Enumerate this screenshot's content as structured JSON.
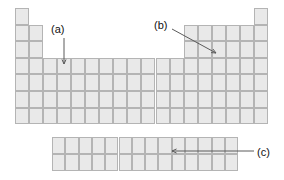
{
  "figure": {
    "type": "periodic-table-schematic",
    "background_color": "#ffffff",
    "cell_fill_color": "#e9e9e9",
    "cell_border_color": "#b4b4b4",
    "arrow_color": "#5a5a5a",
    "label_color": "#111111"
  },
  "main_table": {
    "columns": 18,
    "rows": 7,
    "origin_x": 15,
    "origin_y": 8,
    "cell_width": 14.05,
    "cell_height": 16.6,
    "row_spans": [
      {
        "row": 1,
        "groups": [
          [
            1,
            1
          ],
          [
            18,
            18
          ]
        ]
      },
      {
        "row": 2,
        "groups": [
          [
            1,
            2
          ],
          [
            13,
            18
          ]
        ]
      },
      {
        "row": 3,
        "groups": [
          [
            1,
            2
          ],
          [
            13,
            18
          ]
        ]
      },
      {
        "row": 4,
        "groups": [
          [
            1,
            18
          ]
        ]
      },
      {
        "row": 5,
        "groups": [
          [
            1,
            18
          ]
        ]
      },
      {
        "row": 6,
        "groups": [
          [
            1,
            18
          ]
        ]
      },
      {
        "row": 7,
        "groups": [
          [
            1,
            18
          ]
        ]
      }
    ]
  },
  "f_block": {
    "columns": 14,
    "rows": 2,
    "origin_x": 52,
    "origin_y": 137,
    "cell_width": 13.3,
    "cell_height": 17.0
  },
  "annotations": [
    {
      "id": "a",
      "label": "(a)",
      "label_x": 51,
      "label_y": 24,
      "arrow": {
        "shape": "straight",
        "x1": 64,
        "y1": 38,
        "x2": 64,
        "y2": 64,
        "head": "down"
      }
    },
    {
      "id": "b",
      "label": "(b)",
      "label_x": 154,
      "label_y": 20,
      "arrow": {
        "shape": "straight",
        "x1": 172,
        "y1": 29,
        "x2": 216,
        "y2": 53,
        "head": "down-right"
      }
    },
    {
      "id": "c",
      "label": "(c)",
      "label_x": 257,
      "label_y": 147,
      "arrow": {
        "shape": "straight",
        "x1": 254,
        "y1": 151,
        "x2": 172,
        "y2": 151,
        "head": "left"
      }
    }
  ]
}
